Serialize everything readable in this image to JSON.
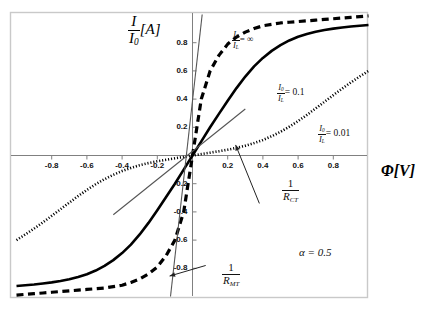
{
  "figure": {
    "y_axis_title_num": "I",
    "y_axis_title_den": "I",
    "y_axis_title_den_sub": "0",
    "y_axis_title_unit": "[A]",
    "x_axis_title": "Φ[V]"
  },
  "annotations": {
    "alpha": "α = 0.5",
    "r_ct_num": "1",
    "r_ct_den": "R",
    "r_ct_den_sub": "CT",
    "r_mt_num": "1",
    "r_mt_den": "R",
    "r_mt_den_sub": "MT"
  },
  "legend": [
    {
      "num": "I",
      "num_sub": "0",
      "den": "I",
      "den_sub": "L",
      "eq": "= ∞",
      "style": "dashed"
    },
    {
      "num": "I",
      "num_sub": "0",
      "den": "I",
      "den_sub": "L",
      "eq": "= 0.1",
      "style": "solid"
    },
    {
      "num": "I",
      "num_sub": "0",
      "den": "I",
      "den_sub": "L",
      "eq": "= 0.01",
      "style": "dotted"
    }
  ],
  "chart_data": {
    "type": "line",
    "title": "",
    "subtitle": "",
    "xlabel": "Φ[V]",
    "ylabel": "I/I0 [A]",
    "xlim": [
      -1.0,
      1.0
    ],
    "ylim": [
      -1.0,
      1.0
    ],
    "grid": false,
    "legend_position": "inline-annotations",
    "xticks": [
      -0.8,
      -0.6,
      -0.4,
      -0.2,
      0.2,
      0.4,
      0.6,
      0.8
    ],
    "xtick_labels": [
      "-0.8",
      "-0.6",
      "-0.4",
      "-0.2",
      "0.2",
      "0.4",
      "0.6",
      "0.8"
    ],
    "yticks": [
      -0.8,
      -0.6,
      -0.4,
      -0.2,
      0.2,
      0.4,
      0.6,
      0.8
    ],
    "ytick_labels": [
      "-0.8",
      "-0.6",
      "-0.4",
      "-0.2",
      "0.2",
      "0.4",
      "0.6",
      "0.8"
    ],
    "annotations_text": [
      "I0/IL = ∞",
      "I0/IL = 0.1",
      "I0/IL = 0.01",
      "1/R_CT",
      "1/R_MT",
      "α = 0.5"
    ],
    "parameters": {
      "alpha": 0.5
    },
    "series": [
      {
        "name": "I0/IL = ∞",
        "style": "dashed",
        "color": "#000000",
        "x": [
          -1.0,
          -0.95,
          -0.9,
          -0.85,
          -0.8,
          -0.75,
          -0.7,
          -0.65,
          -0.6,
          -0.55,
          -0.5,
          -0.45,
          -0.4,
          -0.35,
          -0.3,
          -0.25,
          -0.2,
          -0.15,
          -0.1,
          -0.05,
          0,
          0.05,
          0.1,
          0.15,
          0.2,
          0.25,
          0.3,
          0.35,
          0.4,
          0.45,
          0.5,
          0.55,
          0.6,
          0.65,
          0.7,
          0.75,
          0.8,
          0.85,
          0.9,
          0.95,
          1.0
        ],
        "y": [
          -0.99,
          -0.985,
          -0.98,
          -0.975,
          -0.97,
          -0.965,
          -0.96,
          -0.955,
          -0.95,
          -0.945,
          -0.94,
          -0.93,
          -0.92,
          -0.9,
          -0.875,
          -0.84,
          -0.79,
          -0.71,
          -0.6,
          -0.4,
          0,
          0.4,
          0.6,
          0.71,
          0.79,
          0.84,
          0.875,
          0.9,
          0.92,
          0.93,
          0.94,
          0.945,
          0.95,
          0.955,
          0.96,
          0.965,
          0.97,
          0.975,
          0.98,
          0.985,
          0.99
        ]
      },
      {
        "name": "I0/IL = 0.1",
        "style": "solid",
        "color": "#000000",
        "x": [
          -1.0,
          -0.95,
          -0.9,
          -0.85,
          -0.8,
          -0.75,
          -0.7,
          -0.65,
          -0.6,
          -0.55,
          -0.5,
          -0.45,
          -0.4,
          -0.35,
          -0.3,
          -0.25,
          -0.2,
          -0.15,
          -0.1,
          -0.05,
          0,
          0.05,
          0.1,
          0.15,
          0.2,
          0.25,
          0.3,
          0.35,
          0.4,
          0.45,
          0.5,
          0.55,
          0.6,
          0.65,
          0.7,
          0.75,
          0.8,
          0.85,
          0.9,
          0.95,
          1.0
        ],
        "y": [
          -0.925,
          -0.92,
          -0.915,
          -0.908,
          -0.9,
          -0.89,
          -0.878,
          -0.862,
          -0.842,
          -0.816,
          -0.783,
          -0.742,
          -0.692,
          -0.632,
          -0.56,
          -0.478,
          -0.388,
          -0.295,
          -0.2,
          -0.1,
          0,
          0.1,
          0.2,
          0.295,
          0.388,
          0.478,
          0.56,
          0.632,
          0.692,
          0.742,
          0.783,
          0.816,
          0.842,
          0.862,
          0.878,
          0.89,
          0.9,
          0.908,
          0.915,
          0.92,
          0.925
        ]
      },
      {
        "name": "I0/IL = 0.01",
        "style": "dotted",
        "color": "#000000",
        "x": [
          -1.0,
          -0.95,
          -0.9,
          -0.85,
          -0.8,
          -0.75,
          -0.7,
          -0.65,
          -0.6,
          -0.55,
          -0.5,
          -0.45,
          -0.4,
          -0.35,
          -0.3,
          -0.25,
          -0.2,
          -0.15,
          -0.1,
          -0.05,
          0,
          0.05,
          0.1,
          0.15,
          0.2,
          0.25,
          0.3,
          0.35,
          0.4,
          0.45,
          0.5,
          0.55,
          0.6,
          0.65,
          0.7,
          0.75,
          0.8,
          0.85,
          0.9,
          0.95,
          1.0
        ],
        "y": [
          -0.6,
          -0.56,
          -0.518,
          -0.474,
          -0.428,
          -0.381,
          -0.334,
          -0.288,
          -0.244,
          -0.204,
          -0.168,
          -0.137,
          -0.11,
          -0.088,
          -0.069,
          -0.054,
          -0.041,
          -0.03,
          -0.02,
          -0.01,
          0,
          0.01,
          0.02,
          0.03,
          0.041,
          0.054,
          0.069,
          0.088,
          0.11,
          0.137,
          0.168,
          0.204,
          0.244,
          0.288,
          0.334,
          0.381,
          0.428,
          0.474,
          0.518,
          0.56,
          0.6
        ]
      }
    ],
    "tangent_lines": [
      {
        "name": "1/R_MT",
        "from": [
          -0.125,
          -1.0
        ],
        "to": [
          0.055,
          1.0
        ]
      },
      {
        "name": "1/R_CT",
        "from": [
          -0.45,
          -0.42
        ],
        "to": [
          0.3,
          0.33
        ]
      }
    ],
    "arrows": [
      {
        "name": "r_ct_arrow",
        "from": [
          0.38,
          -0.34
        ],
        "to": [
          0.245,
          0.075
        ]
      },
      {
        "name": "r_mt_arrow",
        "from": [
          0.075,
          -0.78
        ],
        "to": [
          -0.13,
          -0.855
        ]
      }
    ]
  }
}
